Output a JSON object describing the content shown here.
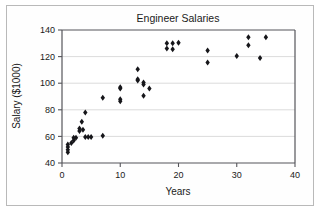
{
  "figure": {
    "background_color": "#ffffff",
    "frame_color": "#b9b9b9",
    "marker_color": "#16161a",
    "grid_color": "#d2d2d2",
    "axis_color": "#55555a"
  },
  "chart_data": {
    "type": "scatter",
    "title": "Engineer Salaries",
    "xlabel": "Years",
    "ylabel": "Salary ($1000)",
    "xlim": [
      0,
      40
    ],
    "ylim": [
      40,
      140
    ],
    "xticks": [
      0,
      10,
      20,
      30,
      40
    ],
    "yticks": [
      40,
      60,
      80,
      100,
      120,
      140
    ],
    "xtick_labels": [
      "0",
      "10",
      "20",
      "30",
      "40"
    ],
    "ytick_labels": [
      "40",
      "60",
      "80",
      "100",
      "120",
      "140"
    ],
    "grid": "horizontal",
    "legend": "none",
    "marker_shape": "diamond",
    "series": [
      {
        "name": "Engineers",
        "points": [
          [
            1,
            48
          ],
          [
            1,
            50
          ],
          [
            1,
            52
          ],
          [
            1,
            54
          ],
          [
            1.6,
            55
          ],
          [
            2,
            57
          ],
          [
            2,
            59
          ],
          [
            2.4,
            59
          ],
          [
            3,
            66
          ],
          [
            3,
            64
          ],
          [
            3.4,
            71
          ],
          [
            3.6,
            65
          ],
          [
            4,
            78
          ],
          [
            4,
            59.5
          ],
          [
            4.5,
            59.5
          ],
          [
            5,
            59.5
          ],
          [
            7,
            60.5
          ],
          [
            7,
            89
          ],
          [
            10,
            96
          ],
          [
            10,
            97
          ],
          [
            10,
            88
          ],
          [
            10,
            86.5
          ],
          [
            13,
            110.5
          ],
          [
            13,
            102
          ],
          [
            13,
            103
          ],
          [
            14,
            100.5
          ],
          [
            14,
            99
          ],
          [
            14,
            90.5
          ],
          [
            15,
            96
          ],
          [
            18,
            130
          ],
          [
            18,
            126
          ],
          [
            19,
            130
          ],
          [
            19,
            125.5
          ],
          [
            20,
            130.5
          ],
          [
            25,
            124.5
          ],
          [
            25,
            115.5
          ],
          [
            30,
            120.5
          ],
          [
            32,
            134.5
          ],
          [
            32,
            128.5
          ],
          [
            34,
            119
          ],
          [
            35,
            134.5
          ]
        ]
      }
    ]
  }
}
